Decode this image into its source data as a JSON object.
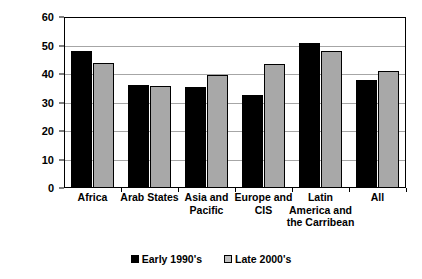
{
  "chart_data": {
    "type": "bar",
    "title": "",
    "xlabel": "",
    "ylabel": "",
    "ylim": [
      0,
      60
    ],
    "yticks": [
      0,
      10,
      20,
      30,
      40,
      50,
      60
    ],
    "grid": true,
    "legend_position": "bottom",
    "categories": [
      "Africa",
      "Arab States",
      "Asia and\nPacific",
      "Europe and\nCIS",
      "Latin\nAmerica and\nthe Carribean",
      "All"
    ],
    "series": [
      {
        "name": "Early 1990's",
        "color": "#000000",
        "values": [
          48,
          36,
          35.5,
          32.5,
          51,
          38
        ]
      },
      {
        "name": "Late 2000's",
        "color": "#a8a8a8",
        "values": [
          44,
          35.8,
          39.5,
          43.5,
          48,
          41
        ]
      }
    ]
  },
  "legend": {
    "items": [
      {
        "label": "Early 1990's",
        "swatch": "legend-swatch-black"
      },
      {
        "label": "Late 2000's",
        "swatch": "legend-swatch-gray"
      }
    ]
  }
}
